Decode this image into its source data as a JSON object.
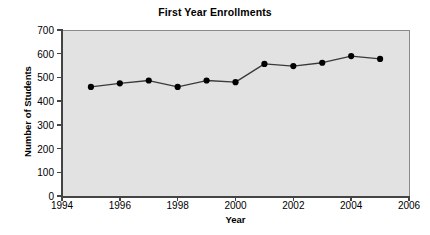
{
  "chart_data": {
    "type": "line",
    "title": "First Year Enrollments",
    "xlabel": "Year",
    "ylabel": "Number of Students",
    "x": [
      1995,
      1996,
      1997,
      1998,
      1999,
      2000,
      2001,
      2002,
      2003,
      2004,
      2005
    ],
    "values": [
      460,
      475,
      487,
      460,
      487,
      480,
      557,
      548,
      562,
      590,
      578
    ],
    "series": [
      {
        "name": "First Year Enrollments",
        "values": [
          460,
          475,
          487,
          460,
          487,
          480,
          557,
          548,
          562,
          590,
          578
        ]
      }
    ],
    "xlim": [
      1994,
      2006
    ],
    "ylim": [
      0,
      700
    ],
    "xticks": [
      1994,
      1996,
      1998,
      2000,
      2002,
      2004,
      2006
    ],
    "xtick_labels": [
      "1994",
      "1996",
      "1998",
      "2000",
      "2002",
      "2004",
      "2006"
    ],
    "yticks": [
      0,
      100,
      200,
      300,
      400,
      500,
      600,
      700
    ],
    "ytick_labels": [
      "0",
      "100",
      "200",
      "300",
      "400",
      "500",
      "600",
      "700"
    ],
    "grid": false,
    "legend": null,
    "legend_position": "none",
    "marker": "filled-circle",
    "line_color": "#3a3a3a",
    "marker_color": "#000000",
    "plot_background_color": "#e2e2e2",
    "figure_background_color": "#ffffff",
    "axis_color": "#444444"
  }
}
